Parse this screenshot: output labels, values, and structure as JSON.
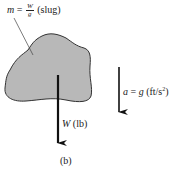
{
  "figure": {
    "caption": "(b)",
    "body": {
      "fill_color": "#b8b8b8",
      "outline_color": "#333333"
    },
    "mass_label": {
      "symbol": "m",
      "equals": "=",
      "numerator": "W",
      "denominator": "g",
      "unit": "(slug)"
    },
    "weight_vector": {
      "symbol": "W",
      "unit": "(lb)",
      "direction": "down"
    },
    "acceleration_vector": {
      "symbol": "a",
      "equals": "=",
      "value": "g",
      "unit_prefix": "(ft/s",
      "unit_exp": "2",
      "unit_suffix": ")",
      "direction": "down"
    }
  }
}
